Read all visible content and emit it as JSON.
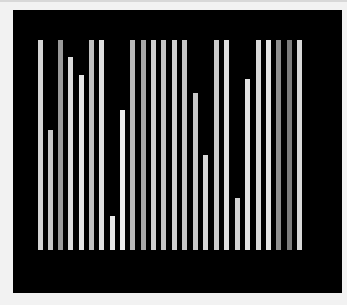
{
  "panel": {
    "background": "#000000"
  },
  "bars": [
    {
      "x": 38,
      "top": 40,
      "color": "#d4d4d4"
    },
    {
      "x": 48,
      "top": 130,
      "color": "#c8c8c8"
    },
    {
      "x": 58,
      "top": 40,
      "color": "#9a9a9a"
    },
    {
      "x": 68,
      "top": 57,
      "color": "#dcdcdc"
    },
    {
      "x": 79,
      "top": 75,
      "color": "#e6e6e6"
    },
    {
      "x": 89,
      "top": 40,
      "color": "#c0c0c0"
    },
    {
      "x": 99,
      "top": 40,
      "color": "#e0e0e0"
    },
    {
      "x": 110,
      "top": 216,
      "color": "#e8e8e8"
    },
    {
      "x": 120,
      "top": 110,
      "color": "#ececec"
    },
    {
      "x": 130,
      "top": 40,
      "color": "#b8b8b8"
    },
    {
      "x": 141,
      "top": 40,
      "color": "#a8a8a8"
    },
    {
      "x": 151,
      "top": 40,
      "color": "#cfcfcf"
    },
    {
      "x": 161,
      "top": 40,
      "color": "#c4c4c4"
    },
    {
      "x": 172,
      "top": 40,
      "color": "#d0d0d0"
    },
    {
      "x": 182,
      "top": 40,
      "color": "#c6c6c6"
    },
    {
      "x": 193,
      "top": 93,
      "color": "#c8c8c8"
    },
    {
      "x": 203,
      "top": 155,
      "color": "#d6d6d6"
    },
    {
      "x": 214,
      "top": 40,
      "color": "#cccccc"
    },
    {
      "x": 224,
      "top": 40,
      "color": "#dedede"
    },
    {
      "x": 235,
      "top": 198,
      "color": "#d2d2d2"
    },
    {
      "x": 245,
      "top": 79,
      "color": "#e2e2e2"
    },
    {
      "x": 256,
      "top": 40,
      "color": "#dadada"
    },
    {
      "x": 266,
      "top": 40,
      "color": "#e4e4e4"
    },
    {
      "x": 276,
      "top": 40,
      "color": "#8e8e8e"
    },
    {
      "x": 287,
      "top": 40,
      "color": "#7c7c7c"
    },
    {
      "x": 297,
      "top": 40,
      "color": "#d8d8d8"
    }
  ],
  "baseline": 250
}
